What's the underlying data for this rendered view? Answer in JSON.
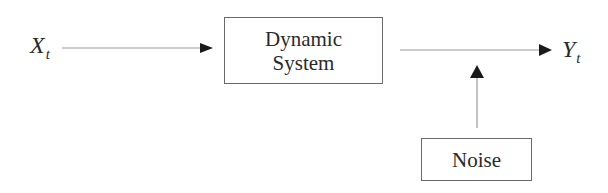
{
  "diagram": {
    "input": {
      "symbol": "X",
      "subscript": "t"
    },
    "output": {
      "symbol": "Y",
      "subscript": "t"
    },
    "system_box": {
      "line1": "Dynamic",
      "line2": "System"
    },
    "noise_box": {
      "label": "Noise"
    },
    "edges": [
      {
        "from": "input",
        "to": "system_box"
      },
      {
        "from": "system_box",
        "to": "output"
      },
      {
        "from": "noise_box",
        "to": "system_output_edge"
      }
    ],
    "colors": {
      "line": "#9a9a9a",
      "arrowhead": "#1a1a1a",
      "box_border": "#6a6a6a",
      "text": "#2a2a2a"
    }
  }
}
